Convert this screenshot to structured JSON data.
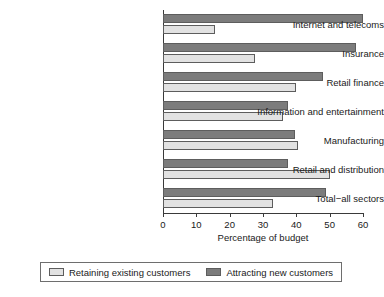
{
  "chart_data": {
    "type": "bar",
    "orientation": "horizontal",
    "title": "",
    "xlabel": "Percentage of budget",
    "ylabel": "",
    "xlim": [
      0,
      60
    ],
    "xticks": [
      0,
      10,
      20,
      30,
      40,
      50,
      60
    ],
    "grid": false,
    "legend_position": "bottom",
    "categories": [
      "Internet and telecoms",
      "Insurance",
      "Retail finance",
      "Information and entertainment",
      "Manufacturing",
      "Retail and distribution",
      "Total−all sectors"
    ],
    "series": [
      {
        "name": "Retaining existing customers",
        "color": "#e2e2e2",
        "values": [
          15.5,
          27.5,
          40,
          36,
          40.5,
          50,
          33
        ]
      },
      {
        "name": "Attracting new customers",
        "color": "#7c7c7c",
        "values": [
          60,
          58,
          48,
          37.5,
          39.5,
          37.5,
          49
        ]
      }
    ]
  },
  "axis": {
    "x_title": "Percentage of budget",
    "tick_labels": [
      "0",
      "10",
      "20",
      "30",
      "40",
      "50",
      "60"
    ]
  },
  "legend": {
    "entries": [
      {
        "label": "Retaining existing customers",
        "color": "#e2e2e2"
      },
      {
        "label": "Attracting new customers",
        "color": "#7c7c7c"
      }
    ]
  },
  "colors": {
    "retaining": "#e2e2e2",
    "attracting": "#7c7c7c",
    "axis": "#3a3a3a",
    "bar_edge": "#5d5d5d",
    "text": "#1a1a1a",
    "background": "#ffffff"
  }
}
